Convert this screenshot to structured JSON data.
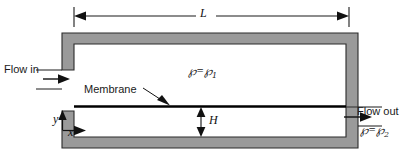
{
  "figure": {
    "type": "technical-diagram",
    "colors": {
      "wall_fill": "#9a9a9a",
      "wall_stroke": "#2b2b2b",
      "membrane": "#000000",
      "line": "#1a1a1a",
      "background": "#ffffff"
    }
  },
  "labels": {
    "flow_in": "Flow in",
    "flow_out": "Flow out",
    "membrane": "Membrane",
    "length_dim": "L",
    "height_dim": "H",
    "axis_x": "x",
    "axis_y": "y"
  },
  "pressures": {
    "upper": {
      "symbol": "℘",
      "equals": "=",
      "value_symbol": "℘",
      "subscript": "1",
      "text": "℘ = ℘1"
    },
    "lower": {
      "symbol": "℘",
      "equals": "=",
      "value_symbol": "℘",
      "subscript": "2",
      "text": "℘ = ℘2"
    }
  },
  "annotations": {
    "length_description": "Overall channel length dimension line spanning the top of the channel",
    "height_description": "Gap height between membrane and lower wall"
  }
}
